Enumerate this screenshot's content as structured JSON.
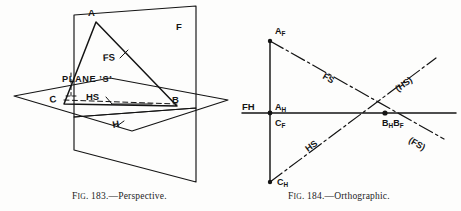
{
  "figures": [
    {
      "id": "fig-183",
      "caption_prefix": "F",
      "caption_small": "IG",
      "caption_rest": ". 183.—Perspective.",
      "caption_full": "Fig. 183.—Perspective.",
      "type": "perspective-pictorial",
      "labels": {
        "vertex_a": "A",
        "vertex_b": "B",
        "vertex_c": "C",
        "plane_f": "F",
        "plane_h": "H",
        "trace_fs": "FS",
        "trace_hs": "HS",
        "plane_s": "PLANE ʻSʻ"
      }
    },
    {
      "id": "fig-184",
      "caption_prefix": "F",
      "caption_small": "IG",
      "caption_rest": ". 184.—Orthographic.",
      "caption_full": "Fig. 184.—Orthographic.",
      "type": "orthographic-projection",
      "labels": {
        "ground_line": "FH",
        "a_front": "A",
        "a_front_sub": "F",
        "a_horiz": "A",
        "a_horiz_sub": "H",
        "c_front": "C",
        "c_front_sub": "F",
        "c_horiz": "C",
        "c_horiz_sub": "H",
        "b_horiz": "B",
        "b_horiz_sub": "H",
        "b_front": "B",
        "b_front_sub": "F",
        "trace_fs": "FS",
        "trace_hs": "HS",
        "ext_hs": "(HS)",
        "ext_fs": "(FS)"
      }
    }
  ],
  "colors": {
    "ink": "#141414",
    "paper": "#fdfdfc"
  }
}
